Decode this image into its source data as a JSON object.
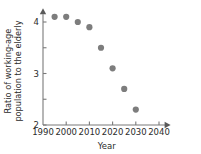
{
  "chart_data": {
    "type": "scatter",
    "title": "",
    "xlabel": "Year",
    "ylabel": "Ratio of working-age population to the elderly",
    "ylabel_lines": [
      "Ratio of working-age",
      "population to the elderly"
    ],
    "x": [
      1995,
      2000,
      2005,
      2010,
      2015,
      2020,
      2025,
      2030
    ],
    "values": [
      4.1,
      4.1,
      4.0,
      3.9,
      3.5,
      3.1,
      2.7,
      2.3
    ],
    "series": [
      {
        "name": "Ratio of working-age population to the elderly",
        "points": [
          {
            "x": 1995,
            "y": 4.1
          },
          {
            "x": 2000,
            "y": 4.1
          },
          {
            "x": 2005,
            "y": 4.0
          },
          {
            "x": 2010,
            "y": 3.9
          },
          {
            "x": 2015,
            "y": 3.5
          },
          {
            "x": 2020,
            "y": 3.1
          },
          {
            "x": 2025,
            "y": 2.7
          },
          {
            "x": 2030,
            "y": 2.3
          }
        ]
      }
    ],
    "xlim": [
      1990,
      2045
    ],
    "ylim": [
      2,
      4.25
    ],
    "xticks": [
      1990,
      2000,
      2010,
      2020,
      2030,
      2040
    ],
    "xtick_labels": [
      "1990",
      "2000",
      "2010",
      "2020",
      "2030",
      "2040"
    ],
    "yticks": [
      2,
      2.5,
      3,
      3.5,
      4
    ],
    "ytick_labels": [
      "2",
      "",
      "3",
      "",
      "4"
    ],
    "ytick_labeled": [
      {
        "value": 4,
        "label": "4"
      },
      {
        "value": 3.5,
        "label": ""
      },
      {
        "value": 3,
        "label": "3"
      },
      {
        "value": 2.5,
        "label": ""
      },
      {
        "value": 2,
        "label": "2"
      }
    ],
    "grid": false,
    "legend": "none",
    "marker": "circle",
    "marker_color": "#7d7d7d",
    "axis_color": "#7a7a7a",
    "text_color": "#2b2b2b",
    "background": "#ffffff",
    "axis_arrows": [
      "x-right",
      "y-up"
    ]
  }
}
